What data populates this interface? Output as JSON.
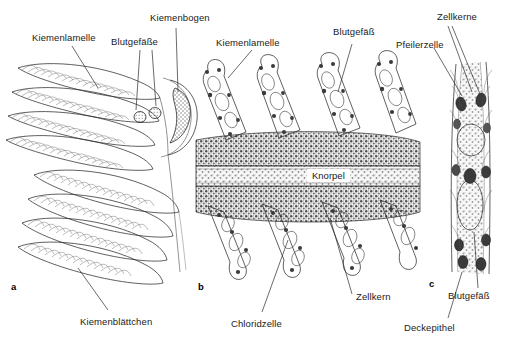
{
  "figure": {
    "background_color": "#ffffff",
    "ink_color": "#2b2b2b",
    "width": 523,
    "height": 346
  },
  "panels": [
    {
      "id": "a",
      "letter": "a",
      "caption": "Schematische Darstellung eines Kiemenbogens mit Kiemenblättchen und Kiemenlamellen",
      "type": "schematic-drawing"
    },
    {
      "id": "b",
      "letter": "b",
      "caption": "Histologischer Querschnitt durch Kiemenblättchen beidseits des Knorpels",
      "type": "histological-section"
    },
    {
      "id": "c",
      "letter": "c",
      "caption": "Detail einer Kiemenlamelle mit Pfeilerzellen und Blutraum",
      "type": "histological-detail"
    }
  ],
  "labels": {
    "a_kiemenlamelle": "Kiemenlamelle",
    "a_blutgefaesse": "Blutgefäße",
    "a_kiemenbogen": "Kiemenbogen",
    "a_kiemenblaettchen": "Kiemenblättchen",
    "b_kiemenlamelle": "Kiemenlamelle",
    "b_blutgefaess": "Blutgefäß",
    "b_knorpel": "Knorpel",
    "b_zellkern": "Zellkern",
    "b_chloridzelle": "Chloridzelle",
    "c_zellkerne": "Zellkerne",
    "c_pfeilerzelle": "Pfeilerzelle",
    "c_blutgefaess": "Blutgefäß",
    "c_deckepithel": "Deckepithel"
  },
  "panel_letters": {
    "a": "a",
    "b": "b",
    "c": "c"
  }
}
